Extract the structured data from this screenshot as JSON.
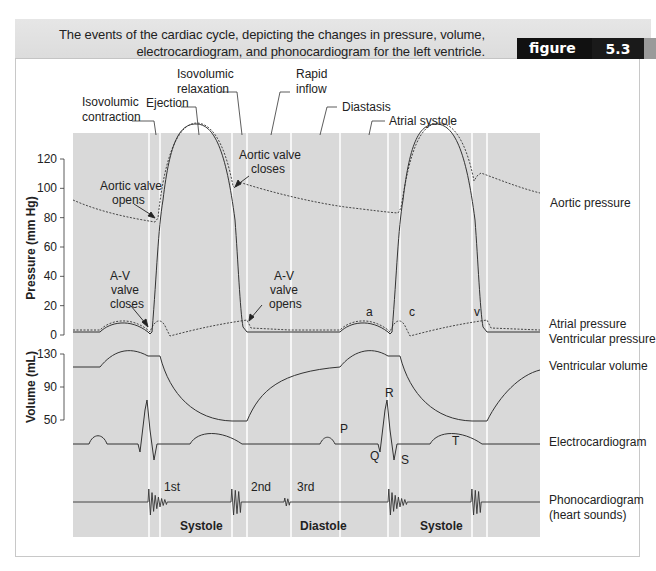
{
  "header": {
    "caption_line1": "The events of the cardiac cycle, depicting the changes in pressure, volume,",
    "caption_line2": "electrocardiogram, and phonocardiogram for the left ventricle.",
    "figure_word": "figure",
    "figure_number": "5.3"
  },
  "colors": {
    "plot_background": "#d9d9d9",
    "phase_divider": "#ffffff",
    "trace": "#333333",
    "header_bar": "#e0e0e0",
    "figure_label_bg": "#111111"
  },
  "phases": {
    "isovolumic_contraction": [
      "Isovolumic",
      "contraction"
    ],
    "ejection": "Ejection",
    "isovolumic_relaxation": [
      "Isovolumic",
      "relaxation"
    ],
    "rapid_inflow": [
      "Rapid",
      "inflow"
    ],
    "diastasis": "Diastasis",
    "atrial_systole": "Atrial systole"
  },
  "annotations": {
    "aortic_valve_opens": [
      "Aortic valve",
      "opens"
    ],
    "aortic_valve_closes": [
      "Aortic valve",
      "closes"
    ],
    "av_valve_closes": [
      "A-V",
      "valve",
      "closes"
    ],
    "av_valve_opens": [
      "A-V",
      "valve",
      "opens"
    ],
    "atrial_waves": [
      "a",
      "c",
      "v"
    ],
    "ecg_waves": [
      "P",
      "Q",
      "R",
      "S",
      "T"
    ],
    "heart_sounds": [
      "1st",
      "2nd",
      "3rd"
    ],
    "periods": [
      "Systole",
      "Diastole",
      "Systole"
    ]
  },
  "series_labels": {
    "aortic_pressure": "Aortic pressure",
    "atrial_pressure": "Atrial pressure",
    "ventricular_pressure": "Ventricular pressure",
    "ventricular_volume": "Ventricular volume",
    "electrocardiogram": "Electrocardiogram",
    "phonocardiogram": [
      "Phonocardiogram",
      "(heart sounds)"
    ]
  },
  "axes": {
    "pressure": {
      "label": "Pressure (mm Hg)",
      "ticks": [
        "120",
        "100",
        "80",
        "60",
        "40",
        "20",
        "0"
      ],
      "range": [
        0,
        120
      ]
    },
    "volume": {
      "label": "Volume (mL)",
      "ticks": [
        "130",
        "90",
        "50"
      ],
      "range": [
        50,
        130
      ]
    }
  }
}
